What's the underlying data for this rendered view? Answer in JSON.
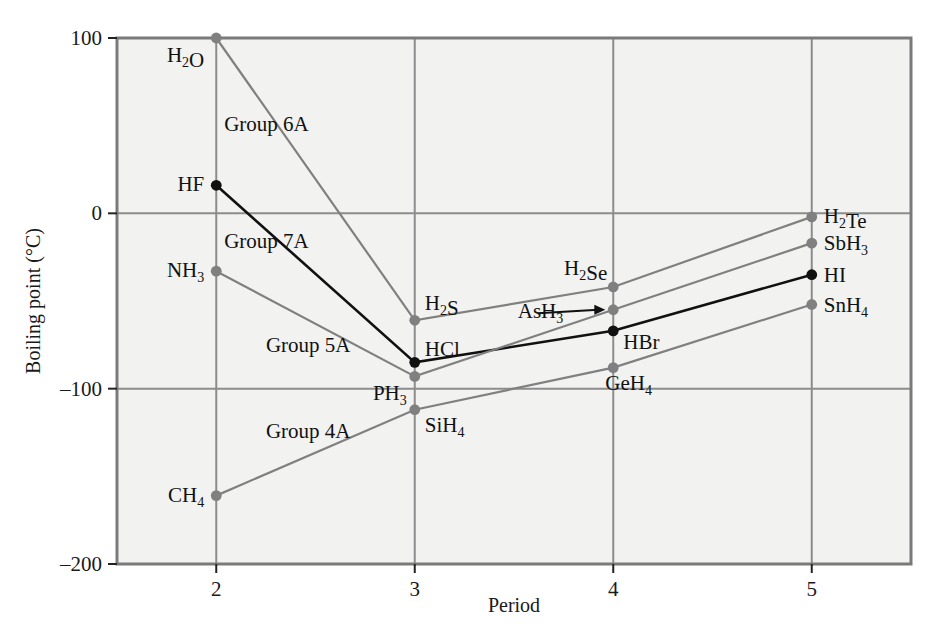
{
  "chart_data": {
    "type": "line",
    "title": "",
    "xlabel": "Period",
    "ylabel": "Boiling point (°C)",
    "xlim": [
      1.5,
      5.5
    ],
    "ylim": [
      -200,
      100
    ],
    "xticks": [
      "2",
      "3",
      "4",
      "5"
    ],
    "xtick_values": [
      2,
      3,
      4,
      5
    ],
    "yticks": [
      "100",
      "0",
      "–100",
      "–200"
    ],
    "ytick_values": [
      100,
      0,
      -100,
      -200
    ],
    "grid": true,
    "legend": "inline-annotations",
    "x": [
      2,
      3,
      4,
      5
    ],
    "series": [
      {
        "name": "Group 6A",
        "color": "#808080",
        "marker_color": "#808080",
        "values": [
          100,
          -61,
          -42,
          -2
        ],
        "point_labels": [
          "H2O",
          "H2S",
          "H2Se",
          "H2Te"
        ]
      },
      {
        "name": "Group 7A",
        "color": "#111111",
        "marker_color": "#111111",
        "values": [
          16,
          -85,
          -67,
          -35
        ],
        "point_labels": [
          "HF",
          "HCl",
          "HBr",
          "HI"
        ]
      },
      {
        "name": "Group 5A",
        "color": "#808080",
        "marker_color": "#808080",
        "values": [
          -33,
          -93,
          -55,
          -17
        ],
        "point_labels": [
          "NH3",
          "PH3",
          "AsH3",
          "SbH3"
        ]
      },
      {
        "name": "Group 4A",
        "color": "#808080",
        "marker_color": "#808080",
        "values": [
          -161,
          -112,
          -88,
          -52
        ],
        "point_labels": [
          "CH4",
          "SiH4",
          "GeH4",
          "SnH4"
        ]
      }
    ]
  },
  "axes": {
    "x_title": "Period",
    "y_title": "Boiling point (°C)",
    "x_tick_labels": [
      "2",
      "3",
      "4",
      "5"
    ],
    "y_tick_labels": [
      "100",
      "0",
      "–100",
      "–200"
    ]
  },
  "group_labels": [
    {
      "text": "Group 6A",
      "x": 2.04,
      "y": 47
    },
    {
      "text": "Group 7A",
      "x": 2.04,
      "y": -20
    },
    {
      "text": "Group 5A",
      "x": 2.25,
      "y": -79
    },
    {
      "text": "Group 4A",
      "x": 2.25,
      "y": -128
    }
  ],
  "point_labels": [
    {
      "base": "H",
      "sub1": "2",
      "rest": "O",
      "anchor": "end",
      "x": 2,
      "y": 100,
      "dx": -12,
      "dy": 24
    },
    {
      "base": "H",
      "sub1": "",
      "rest": "F",
      "anchor": "end",
      "x": 2,
      "y": 16,
      "dx": -12,
      "dy": 6
    },
    {
      "base": "N",
      "sub1": "",
      "rest": "H",
      "sub2": "3",
      "anchor": "end",
      "x": 2,
      "y": -33,
      "dx": -12,
      "dy": 6
    },
    {
      "base": "C",
      "sub1": "",
      "rest": "H",
      "sub2": "4",
      "anchor": "end",
      "x": 2,
      "y": -161,
      "dx": -12,
      "dy": 6
    },
    {
      "base": "H",
      "sub1": "2",
      "rest": "S",
      "anchor": "start",
      "x": 3,
      "y": -61,
      "dx": 10,
      "dy": -10
    },
    {
      "base": "H",
      "sub1": "",
      "rest": "Cl",
      "anchor": "start",
      "x": 3,
      "y": -85,
      "dx": 10,
      "dy": -6
    },
    {
      "base": "P",
      "sub1": "",
      "rest": "H",
      "sub2": "3",
      "anchor": "end",
      "x": 3,
      "y": -93,
      "dx": -8,
      "dy": 24
    },
    {
      "base": "S",
      "sub1": "",
      "rest": "iH",
      "sub2": "4",
      "anchor": "start",
      "x": 3,
      "y": -112,
      "dx": 10,
      "dy": 22
    },
    {
      "base": "H",
      "sub1": "2",
      "rest": "Se",
      "anchor": "end",
      "x": 4,
      "y": -42,
      "dx": -6,
      "dy": -12
    },
    {
      "base": "A",
      "sub1": "",
      "rest": "sH",
      "sub2": "3",
      "anchor": "end",
      "x": 4,
      "y": -55,
      "dx": -50,
      "dy": 8
    },
    {
      "base": "H",
      "sub1": "",
      "rest": "Br",
      "anchor": "start",
      "x": 4,
      "y": -67,
      "dx": 10,
      "dy": 18
    },
    {
      "base": "G",
      "sub1": "",
      "rest": "eH",
      "sub2": "4",
      "anchor": "start",
      "x": 4,
      "y": -88,
      "dx": -8,
      "dy": 22
    },
    {
      "base": "H",
      "sub1": "2",
      "rest": "Te",
      "anchor": "start",
      "x": 5,
      "y": -2,
      "dx": 12,
      "dy": 6
    },
    {
      "base": "S",
      "sub1": "",
      "rest": "bH",
      "sub2": "3",
      "anchor": "start",
      "x": 5,
      "y": -17,
      "dx": 12,
      "dy": 7
    },
    {
      "base": "H",
      "sub1": "",
      "rest": "I",
      "anchor": "start",
      "x": 5,
      "y": -35,
      "dx": 12,
      "dy": 7
    },
    {
      "base": "S",
      "sub1": "",
      "rest": "nH",
      "sub2": "4",
      "anchor": "start",
      "x": 5,
      "y": -52,
      "dx": 12,
      "dy": 7
    }
  ],
  "annotations": [
    {
      "name": "ash3-arrow",
      "type": "arrow",
      "from_x": 3.62,
      "from_y": -57,
      "to_x": 3.96,
      "to_y": -55
    }
  ],
  "colors": {
    "plot_background": "#f2f2f0",
    "page_background": "#ffffff",
    "grid": "#8c8c8c",
    "border": "#7a7a7a",
    "gray_series": "#808080",
    "black_series": "#111111",
    "text": "#111111"
  }
}
